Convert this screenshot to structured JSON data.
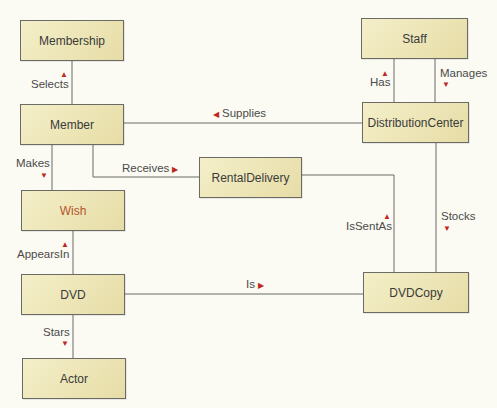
{
  "diagram": {
    "type": "entity-relationship",
    "colors": {
      "entity_fill": "#ece4b4",
      "entity_border": "#6b6b66",
      "line": "#6b6b66",
      "arrow": "#c0281e",
      "background": "#fbfaf3"
    },
    "entities": [
      {
        "id": "membership",
        "label": "Membership"
      },
      {
        "id": "member",
        "label": "Member"
      },
      {
        "id": "wish",
        "label": "Wish"
      },
      {
        "id": "dvd",
        "label": "DVD"
      },
      {
        "id": "actor",
        "label": "Actor"
      },
      {
        "id": "staff",
        "label": "Staff"
      },
      {
        "id": "distributioncenter",
        "label": "DistributionCenter"
      },
      {
        "id": "rentaldelivery",
        "label": "RentalDelivery"
      },
      {
        "id": "dvdcopy",
        "label": "DVDCopy"
      }
    ],
    "relationships": [
      {
        "label": "Selects",
        "from": "Member",
        "to": "Membership",
        "arrow": "up"
      },
      {
        "label": "Makes",
        "from": "Member",
        "to": "Wish",
        "arrow": "down"
      },
      {
        "label": "Receives",
        "from": "Member",
        "to": "RentalDelivery",
        "arrow": "right"
      },
      {
        "label": "Supplies",
        "from": "DistributionCenter",
        "to": "Member",
        "arrow": "left"
      },
      {
        "label": "Has",
        "from": "DistributionCenter",
        "to": "Staff",
        "arrow": "up"
      },
      {
        "label": "Manages",
        "from": "Staff",
        "to": "DistributionCenter",
        "arrow": "down"
      },
      {
        "label": "AppearsIn",
        "from": "DVD",
        "to": "Wish",
        "arrow": "up"
      },
      {
        "label": "IsSentAs",
        "from": "DVDCopy",
        "to": "RentalDelivery",
        "arrow": "up"
      },
      {
        "label": "Stocks",
        "from": "DistributionCenter",
        "to": "DVDCopy",
        "arrow": "down"
      },
      {
        "label": "Is",
        "from": "DVD",
        "to": "DVDCopy",
        "arrow": "right"
      },
      {
        "label": "Stars",
        "from": "DVD",
        "to": "Actor",
        "arrow": "down"
      }
    ],
    "arrow_glyphs": {
      "up": "▲",
      "down": "▼",
      "left": "◀",
      "right": "▶"
    }
  }
}
